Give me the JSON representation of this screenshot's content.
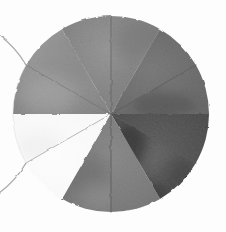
{
  "figure": {
    "background_color": "#fdfdfd",
    "width": 226,
    "height": 232
  },
  "chart_data": {
    "type": "pie",
    "subtitle": "",
    "xlabel": "",
    "ylabel": "",
    "grid": false,
    "legend_position": "none",
    "center": {
      "x": 111,
      "y": 114
    },
    "radius": 98,
    "render_style": "hand-shaded-grayscale-wash",
    "edge_style": "rough pencil outline",
    "categories": [
      "top-left",
      "top-right",
      "right",
      "bottom-right",
      "bottom-left",
      "left"
    ],
    "values": [
      60,
      60,
      60,
      60,
      60,
      60
    ],
    "units": "degrees",
    "slices": [
      {
        "name": "top-left",
        "label": "",
        "start_angle": 180,
        "end_angle": 240,
        "sweep": 60,
        "fill": "#949494",
        "tone_value": 0.58,
        "tone_name": "medium gray",
        "mottle": "light"
      },
      {
        "name": "top-right",
        "label": "",
        "start_angle": 240,
        "end_angle": 300,
        "sweep": 60,
        "fill": "#8a8a8a",
        "tone_value": 0.54,
        "tone_name": "medium-dark gray",
        "mottle": "light"
      },
      {
        "name": "right",
        "label": "",
        "start_angle": 300,
        "end_angle": 360,
        "sweep": 60,
        "fill": "#707070",
        "tone_value": 0.44,
        "tone_name": "dark gray",
        "mottle": "moderate"
      },
      {
        "name": "bottom-right",
        "label": "",
        "start_angle": 0,
        "end_angle": 60,
        "sweep": 60,
        "fill": "#5a5a5a",
        "tone_value": 0.35,
        "tone_name": "darkest gray",
        "mottle": "heavy"
      },
      {
        "name": "bottom-left",
        "label": "",
        "start_angle": 60,
        "end_angle": 120,
        "sweep": 60,
        "fill": "#808080",
        "tone_value": 0.5,
        "tone_name": "mid gray",
        "mottle": "moderate"
      },
      {
        "name": "left",
        "label": "",
        "start_angle": 120,
        "end_angle": 180,
        "sweep": 60,
        "fill": "#f7f7f7",
        "tone_value": 0.97,
        "tone_name": "white",
        "mottle": "none"
      }
    ],
    "palette": {
      "white": "#f7f7f7",
      "light_gray": "#949494",
      "medium_gray": "#8a8a8a",
      "mid_gray": "#808080",
      "dark_gray": "#707070",
      "darkest_gray": "#5a5a5a",
      "shadow": "#3a3a3a",
      "outline": "#6e6e6e",
      "background": "#fdfdfd"
    }
  }
}
